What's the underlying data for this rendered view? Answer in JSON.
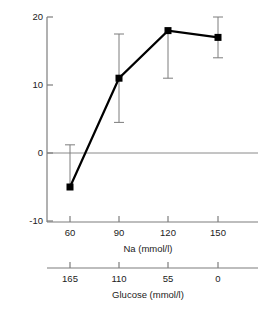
{
  "chart_data": {
    "type": "line",
    "title": "",
    "subtitle": "",
    "xlabel": "Na (mmol/l)",
    "xlabel_secondary": "Glucose (mmol/l)",
    "ylabel": "",
    "ylim": [
      -10,
      20
    ],
    "yticks": [
      "20",
      "10",
      "0",
      "-10"
    ],
    "ytick_values": [
      20,
      10,
      0,
      -10
    ],
    "grid": false,
    "legend": null,
    "zero_line": true,
    "x": [
      60,
      90,
      120,
      150
    ],
    "xticks": [
      "60",
      "90",
      "120",
      "150"
    ],
    "xticks_secondary": [
      "165",
      "110",
      "55",
      "0"
    ],
    "x_secondary_values": [
      165,
      110,
      55,
      0
    ],
    "categories": [
      "60",
      "90",
      "120",
      "150"
    ],
    "values": [
      -5,
      11,
      18,
      17
    ],
    "errors_upper": [
      1.2,
      17.5,
      18,
      20
    ],
    "errors_lower": [
      -5,
      4.5,
      11,
      14
    ],
    "series": [
      {
        "name": "",
        "values": [
          -5,
          11,
          18,
          17
        ],
        "error_low": [
          -5,
          4.5,
          11,
          14
        ],
        "error_high": [
          1.2,
          17.5,
          18,
          20
        ],
        "marker": "square",
        "color": "#000000"
      }
    ],
    "points": [
      {
        "x": 60,
        "glucose": 165,
        "y": -5,
        "low": -5,
        "high": 1.2
      },
      {
        "x": 90,
        "glucose": 110,
        "y": 11,
        "low": 4.5,
        "high": 17.5
      },
      {
        "x": 120,
        "glucose": 55,
        "y": 18,
        "low": 11,
        "high": 18
      },
      {
        "x": 150,
        "glucose": 0,
        "y": 17,
        "low": 14,
        "high": 20
      }
    ]
  },
  "axes": {
    "y_tick_0": "20",
    "y_tick_1": "10",
    "y_tick_2": "0",
    "y_tick_3": "-10",
    "x_tick_0": "60",
    "x_tick_1": "90",
    "x_tick_2": "120",
    "x_tick_3": "150",
    "x2_tick_0": "165",
    "x2_tick_1": "110",
    "x2_tick_2": "55",
    "x2_tick_3": "0",
    "x_axis_title": "Na (mmol/l)",
    "x2_axis_title": "Glucose (mmol/l)"
  },
  "colors": {
    "axis": "#7d7d7d",
    "data_line": "#000000",
    "marker": "#000000",
    "error_bar": "#7d7d7d",
    "zero_line": "#8a8a8a",
    "text": "#222222",
    "background": "#ffffff"
  }
}
